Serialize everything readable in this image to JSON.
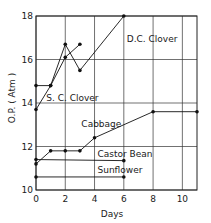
{
  "chart_data": {
    "type": "line",
    "title": "",
    "xlabel": "Days",
    "ylabel": "O.P. ( Atm )",
    "xlim": [
      0,
      11
    ],
    "ylim": [
      10,
      18
    ],
    "xticks": [
      0,
      2,
      4,
      6,
      8,
      10
    ],
    "yticks": [
      10,
      12,
      14,
      16,
      18
    ],
    "xtick_labels": [
      "0",
      "2",
      "4",
      "6",
      "8",
      "10"
    ],
    "ytick_labels": [
      "10",
      "12",
      "14",
      "16",
      "18"
    ],
    "grid": true,
    "legend": "inline labels",
    "series": [
      {
        "name": "D.C. Clover",
        "label": "D.C. Clover",
        "x": [
          0,
          1,
          2,
          3,
          6
        ],
        "y": [
          13.7,
          14.8,
          16.7,
          15.5,
          18.0
        ],
        "label_pos": [
          6.2,
          16.8
        ]
      },
      {
        "name": "S.C. Clover",
        "label": "S. C. Clover",
        "x": [
          0,
          1,
          2,
          3
        ],
        "y": [
          14.8,
          14.8,
          16.1,
          16.7
        ],
        "label_pos": [
          0.7,
          14.1
        ]
      },
      {
        "name": "Cabbage",
        "label": "Cabbage",
        "x": [
          0,
          1,
          2,
          3,
          4,
          8,
          11
        ],
        "y": [
          11.2,
          11.8,
          11.8,
          11.8,
          12.4,
          13.6,
          13.6
        ],
        "label_pos": [
          3.1,
          12.9
        ]
      },
      {
        "name": "Castor Bean",
        "label": "Castor Bean",
        "x": [
          0,
          6
        ],
        "y": [
          11.4,
          11.35
        ],
        "label_pos": [
          4.2,
          11.5
        ]
      },
      {
        "name": "Sunflower",
        "label": "Sunflower",
        "x": [
          0,
          6
        ],
        "y": [
          10.6,
          10.6
        ],
        "label_pos": [
          4.2,
          10.8
        ]
      }
    ]
  }
}
